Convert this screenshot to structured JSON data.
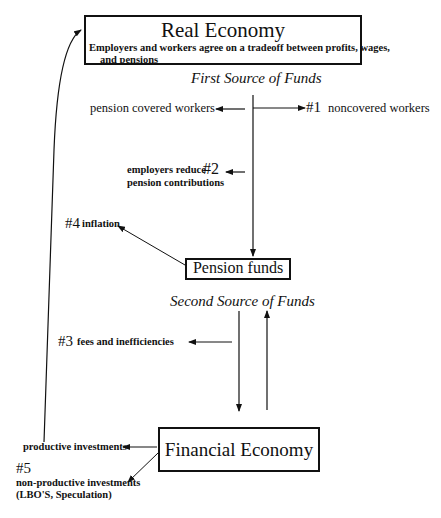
{
  "diagram": {
    "real_economy": {
      "title": "Real Economy",
      "desc_line1": "Employers and workers agree on a tradeoff between profits, wages,",
      "desc_line2": "and pensions"
    },
    "first_source": "First Source of Funds",
    "pension_covered": "pension covered workers",
    "noncovered": {
      "num": "#1",
      "label": "noncovered workers"
    },
    "employers_reduce": {
      "line1": "employers reduce",
      "num": "#2",
      "line2": "pension contributions"
    },
    "inflation": {
      "num": "#4",
      "label": "inflation"
    },
    "pension_funds": "Pension funds",
    "second_source": "Second Source of Funds",
    "fees": {
      "num": "#3",
      "label": "fees and inefficiencies"
    },
    "financial_economy": "Financial Economy",
    "productive": "productive investments",
    "nonproductive": {
      "num": "#5",
      "line1": "non-productive investments",
      "line2": "(LBO'S, Speculation)"
    }
  }
}
